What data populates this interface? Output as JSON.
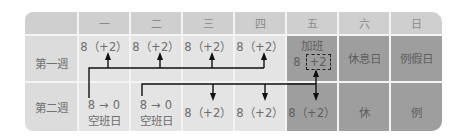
{
  "header": {
    "corner": "",
    "days": [
      "一",
      "二",
      "三",
      "四",
      "五",
      "六",
      "日"
    ]
  },
  "rows": [
    {
      "label": "第一週",
      "cells": [
        {
          "value": "8（+2）"
        },
        {
          "value": "8（+2）"
        },
        {
          "value": "8（+2）"
        },
        {
          "value": "8（+2）"
        },
        {
          "title": "加班",
          "value_prefix": "8",
          "value_boxed": "+2"
        },
        {
          "value": "休息日"
        },
        {
          "value": "例假日"
        }
      ]
    },
    {
      "label": "第二週",
      "cells": [
        {
          "value": "8 → 0",
          "sub": "空班日"
        },
        {
          "value": "8 → 0",
          "sub": "空班日"
        },
        {
          "value": "8（+2）"
        },
        {
          "value": "8（+2）"
        },
        {
          "value": "8（+2）"
        },
        {
          "value": "休"
        },
        {
          "value": "例"
        }
      ]
    }
  ],
  "colors": {
    "header_bg": "#cfcfcf",
    "light_cell_bg": "#e4e4e4",
    "dark_cell_bg": "#9e9e9e",
    "arrow": "#111111"
  }
}
